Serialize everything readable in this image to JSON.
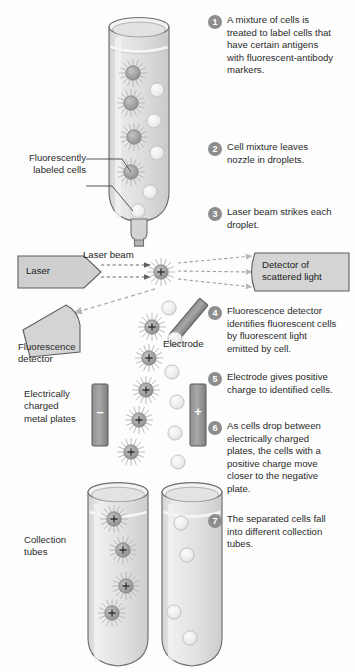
{
  "figure": {
    "background_color": "#ffffff",
    "ink_color": "#231f20",
    "badge_color": "#8d8d8d",
    "fill_gray": "#cfcfcf",
    "tube_gray": "#e3e3e3",
    "cell_gray": "#a9a9a9",
    "plain_cell_gray": "#ececec"
  },
  "steps": [
    {
      "number": "1",
      "text": "A mixture of cells is treated to label cells that have certain antigens with fluorescent-antibody markers."
    },
    {
      "number": "2",
      "text": "Cell mixture leaves nozzle in droplets."
    },
    {
      "number": "3",
      "text": "Laser beam strikes each droplet."
    },
    {
      "number": "4",
      "text": "Fluorescence detector identifies fluorescent cells by fluorescent light emitted by cell."
    },
    {
      "number": "5",
      "text": "Electrode gives positive charge to identified cells."
    },
    {
      "number": "6",
      "text": "As cells drop between electrically charged plates, the cells with a positive charge move closer to the negative plate."
    },
    {
      "number": "7",
      "text": "The separated cells fall into different collection tubes."
    }
  ],
  "labels": {
    "fluorescently_labeled_cells": "Fluorescently\nlabeled cells",
    "fluorescently_labeled_cells_line1": "Fluorescently",
    "fluorescently_labeled_cells_line2": "labeled cells",
    "laser": "Laser",
    "laser_beam": "Laser beam",
    "detector_of_scattered_light_line1": "Detector of",
    "detector_of_scattered_light_line2": "scattered light",
    "fluorescence_detector_line1": "Fluorescence",
    "fluorescence_detector_line2": "detector",
    "electrode": "Electrode",
    "charged_plates_line1": "Electrically",
    "charged_plates_line2": "charged",
    "charged_plates_line3": "metal plates",
    "collection_tubes_line1": "Collection",
    "collection_tubes_line2": "tubes",
    "plate_negative": "–",
    "plate_positive": "+",
    "cell_charge": "+"
  },
  "diagram_elements": {
    "sample_tube": "upper sample tube containing mixed cell suspension",
    "nozzle": "droplet-forming nozzle at base of sample tube",
    "laser_source": "laser emitter pointing right",
    "scatter_detector": "detector of scattered light at right",
    "fluorescence_detector": "fluorescence detector at lower left",
    "electrode": "charging electrode bar",
    "negative_plate": "negatively charged metal plate",
    "positive_plate": "positively charged metal plate",
    "collection_tube_left": "collection tube receiving charged fluorescent cells",
    "collection_tube_right": "collection tube receiving unlabeled cells"
  }
}
